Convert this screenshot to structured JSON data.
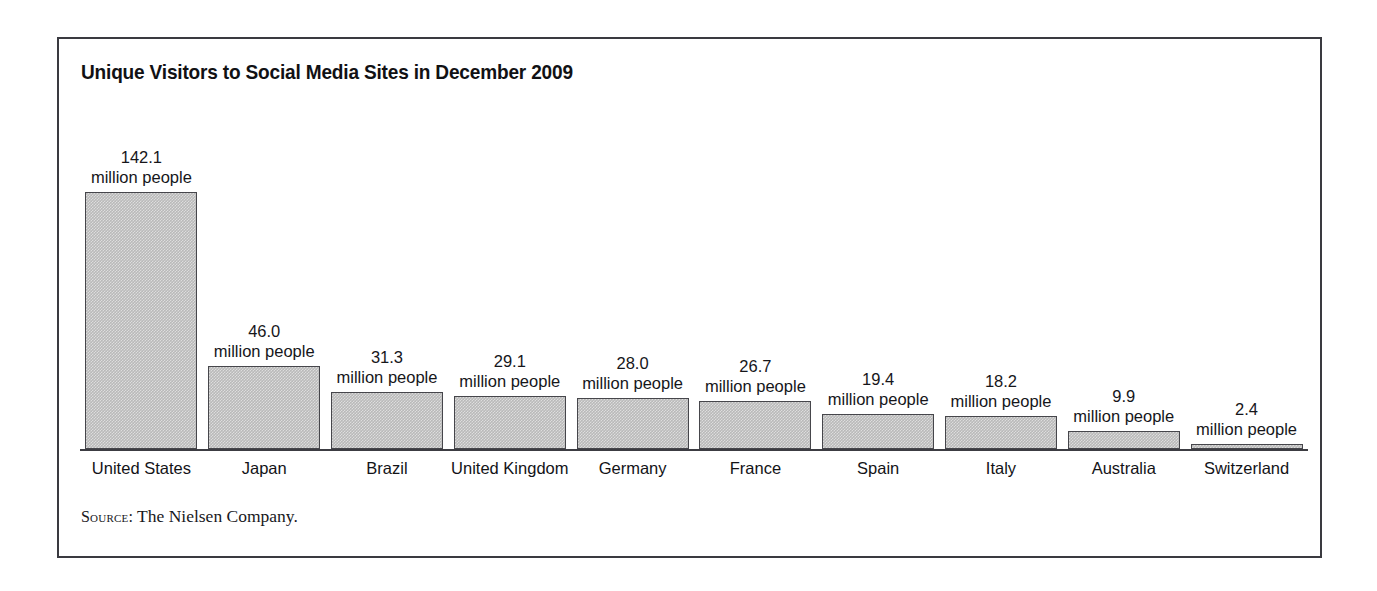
{
  "chart_data": {
    "type": "bar",
    "title": "Unique Visitors to Social Media Sites in December 2009",
    "xlabel": "",
    "ylabel": "",
    "unit_label": "million people",
    "ylim": [
      0,
      142.1
    ],
    "grid": false,
    "legend": "none",
    "categories": [
      "United States",
      "Japan",
      "Brazil",
      "United Kingdom",
      "Germany",
      "France",
      "Spain",
      "Italy",
      "Australia",
      "Switzerland"
    ],
    "values": [
      142.1,
      46.0,
      31.3,
      29.1,
      28.0,
      26.7,
      19.4,
      18.2,
      9.9,
      2.4
    ],
    "value_labels": [
      "142.1",
      "46.0",
      "31.3",
      "29.1",
      "28.0",
      "26.7",
      "19.4",
      "18.2",
      "9.9",
      "2.4"
    ],
    "bars": [
      {
        "category": "United States",
        "value": 142.1,
        "label_num": "142.1",
        "label_unit": "million people"
      },
      {
        "category": "Japan",
        "value": 46.0,
        "label_num": "46.0",
        "label_unit": "million people"
      },
      {
        "category": "Brazil",
        "value": 31.3,
        "label_num": "31.3",
        "label_unit": "million people"
      },
      {
        "category": "United Kingdom",
        "value": 29.1,
        "label_num": "29.1",
        "label_unit": "million people"
      },
      {
        "category": "Germany",
        "value": 28.0,
        "label_num": "28.0",
        "label_unit": "million people"
      },
      {
        "category": "France",
        "value": 26.7,
        "label_num": "26.7",
        "label_unit": "million people"
      },
      {
        "category": "Spain",
        "value": 19.4,
        "label_num": "19.4",
        "label_unit": "million people"
      },
      {
        "category": "Italy",
        "value": 18.2,
        "label_num": "18.2",
        "label_unit": "million people"
      },
      {
        "category": "Australia",
        "value": 9.9,
        "label_num": "9.9",
        "label_unit": "million people"
      },
      {
        "category": "Switzerland",
        "value": 2.4,
        "label_num": "2.4",
        "label_unit": "million people"
      }
    ],
    "colors": {
      "bar_fill": "#b9b9b9",
      "bar_border": "#46464b",
      "axis": "#3c3c42",
      "text": "#16161a",
      "frame": "#3a3a40",
      "background": "#ffffff"
    }
  },
  "source": {
    "label": "Source:",
    "text": "The Nielsen Company."
  }
}
